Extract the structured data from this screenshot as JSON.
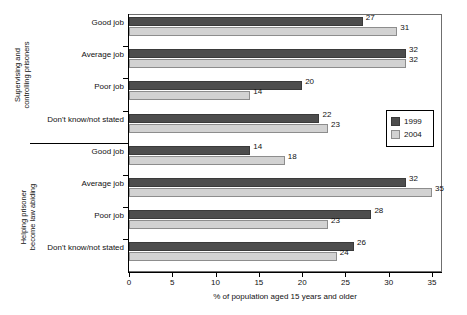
{
  "chart_data": {
    "type": "bar",
    "orientation": "horizontal",
    "title": "",
    "xlabel": "% of population aged 15 years and older",
    "ylabel": "",
    "xlim": [
      0,
      35
    ],
    "xticks": [
      0,
      5,
      10,
      15,
      20,
      25,
      30,
      35
    ],
    "xtick_labels": [
      "0",
      "5",
      "10",
      "15",
      "20",
      "25",
      "30",
      "35"
    ],
    "grid": false,
    "legend_position": "center-right",
    "legend": [
      "1999",
      "2004"
    ],
    "series": [
      {
        "name": "1999",
        "color": "#4d4d4d",
        "values": [
          27,
          32,
          20,
          22,
          14,
          32,
          28,
          26
        ]
      },
      {
        "name": "2004",
        "color": "#d2d2d2",
        "values": [
          31,
          32,
          14,
          23,
          18,
          35,
          23,
          24
        ]
      }
    ],
    "categories": [
      "Good job",
      "Average job",
      "Poor job",
      "Don't know/not stated",
      "Good job",
      "Average job",
      "Poor job",
      "Don't know/not stated"
    ],
    "groups": [
      {
        "label": "Supervising and controlling prisoners",
        "label_line1": "Supervising and",
        "label_line2": "controlling prisoners",
        "categories": [
          "Good job",
          "Average job",
          "Poor job",
          "Don't know/not stated"
        ],
        "series_1999": [
          27,
          32,
          20,
          22
        ],
        "series_2004": [
          31,
          32,
          14,
          23
        ]
      },
      {
        "label": "Helping prisoner become law abiding",
        "label_line1": "Helping prisoner",
        "label_line2": "become law abiding",
        "categories": [
          "Good job",
          "Average job",
          "Poor job",
          "Don't know/not stated"
        ],
        "series_1999": [
          14,
          32,
          28,
          26
        ],
        "series_2004": [
          18,
          35,
          23,
          24
        ]
      }
    ]
  },
  "rows": [
    {
      "label": "Good job",
      "v1999": "27",
      "v2004": "31",
      "n1999": 27,
      "n2004": 31
    },
    {
      "label": "Average job",
      "v1999": "32",
      "v2004": "32",
      "n1999": 32,
      "n2004": 32
    },
    {
      "label": "Poor job",
      "v1999": "20",
      "v2004": "14",
      "n1999": 20,
      "n2004": 14
    },
    {
      "label": "Don't know/not stated",
      "v1999": "22",
      "v2004": "23",
      "n1999": 22,
      "n2004": 23
    },
    {
      "label": "Good job",
      "v1999": "14",
      "v2004": "18",
      "n1999": 14,
      "n2004": 18
    },
    {
      "label": "Average job",
      "v1999": "32",
      "v2004": "35",
      "n1999": 32,
      "n2004": 35
    },
    {
      "label": "Poor job",
      "v1999": "28",
      "v2004": "23",
      "n1999": 28,
      "n2004": 23
    },
    {
      "label": "Don't know/not stated",
      "v1999": "26",
      "v2004": "24",
      "n1999": 26,
      "n2004": 24
    }
  ],
  "legend": {
    "item_1999": "1999",
    "item_2004": "2004"
  },
  "axis": {
    "x_title": "% of population aged 15 years and older",
    "ticks": [
      "0",
      "5",
      "10",
      "15",
      "20",
      "25",
      "30",
      "35"
    ]
  },
  "groups": {
    "g0_line1": "Supervising and",
    "g0_line2": "controlling prisoners",
    "g1_line1": "Helping prisoner",
    "g1_line2": "become law abiding"
  },
  "colors": {
    "series_1999": "#4d4d4d",
    "series_2004": "#d2d2d2",
    "frame": "#6f6f6f",
    "text": "#111111"
  }
}
